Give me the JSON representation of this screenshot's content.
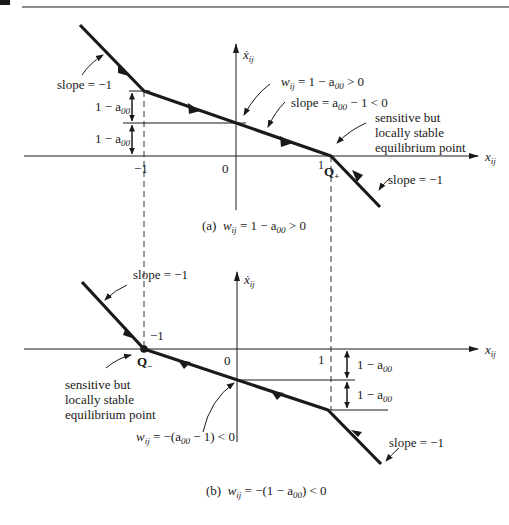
{
  "figure": {
    "header_rule": true,
    "part_a": {
      "caption_prefix": "(a)",
      "caption_w": "w",
      "caption_sub": "ij",
      "caption_rest": " = 1 − a",
      "caption_a_sub": "00",
      "caption_tail": " > 0",
      "y_axis_label": "ẋ",
      "y_axis_sub": "ij",
      "x_axis_label": "x",
      "x_axis_sub": "ij",
      "tick_minus1": "−1",
      "tick_0": "0",
      "tick_1": "1",
      "point_label": "Q",
      "point_sub": "+",
      "slope_left": "slope = −1",
      "slope_right": "slope = −1",
      "w_label": "w",
      "w_sub": "ij",
      "w_rest": " = 1 − a",
      "w_a_sub": "00",
      "w_tail": " > 0",
      "slope_mid": "slope = a",
      "slope_mid_sub": "00",
      "slope_mid_tail": " − 1 < 0",
      "gap1": "1 − a",
      "gap1_sub": "00",
      "gap2": "1 − a",
      "gap2_sub": "00",
      "note_line1": "sensitive but",
      "note_line2": "locally stable",
      "note_line3": "equilibrium point"
    },
    "part_b": {
      "caption_prefix": "(b)",
      "caption_w": "w",
      "caption_sub": "ij",
      "caption_rest": " = −(1 − a",
      "caption_a_sub": "00",
      "caption_tail": ") < 0",
      "y_axis_label": "ẋ",
      "y_axis_sub": "ij",
      "x_axis_label": "x",
      "x_axis_sub": "ij",
      "tick_minus1": "−1",
      "tick_0": "0",
      "tick_1": "1",
      "point_label": "Q",
      "point_sub": "−",
      "slope_left": "slope = −1",
      "slope_right": "slope = −1",
      "w_label": "w",
      "w_sub": "ij",
      "w_rest": " = −(a",
      "w_a_sub": "00",
      "w_tail": " − 1) < 0",
      "gap1": "1 − a",
      "gap1_sub": "00",
      "gap2": "1 − a",
      "gap2_sub": "00",
      "note_line1": "sensitive but",
      "note_line2": "locally stable",
      "note_line3": "equilibrium point"
    },
    "colors": {
      "ink": "#1a1a1a",
      "background": "#ffffff"
    }
  }
}
